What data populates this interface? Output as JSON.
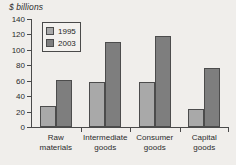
{
  "chart_data": {
    "type": "bar",
    "title": "$ billions",
    "xlabel": "",
    "ylabel": "$ billions",
    "ylim": [
      0,
      140
    ],
    "yticks": [
      0,
      20,
      40,
      60,
      80,
      100,
      120,
      140
    ],
    "ytick_labels": [
      "0",
      "20",
      "40",
      "60",
      "80",
      "100",
      "120",
      "140"
    ],
    "grid": false,
    "legend_position": "top-left",
    "categories": [
      "Raw materials",
      "Intermediate goods",
      "Consumer goods",
      "Capital goods"
    ],
    "category_lines": [
      [
        "Raw",
        "materials"
      ],
      [
        "Intermediate",
        "goods"
      ],
      [
        "Consumer",
        "goods"
      ],
      [
        "Capital",
        "goods"
      ]
    ],
    "series": [
      {
        "name": "1995",
        "color": "#a9a9a9",
        "values": [
          27,
          58,
          58,
          23
        ]
      },
      {
        "name": "2003",
        "color": "#7e7e7e",
        "values": [
          61,
          110,
          118,
          76
        ]
      }
    ]
  },
  "legend": {
    "entries": [
      {
        "label": "1995",
        "swatch": "light-gray"
      },
      {
        "label": "2003",
        "swatch": "dark-gray"
      }
    ]
  },
  "colors": {
    "background": "#f0eeeb",
    "axis": "#4a4a4a",
    "text": "#2b2b2b",
    "series_1995": "#a9a9a9",
    "series_2003": "#7e7e7e",
    "bar_border": "#4c4c4c"
  }
}
